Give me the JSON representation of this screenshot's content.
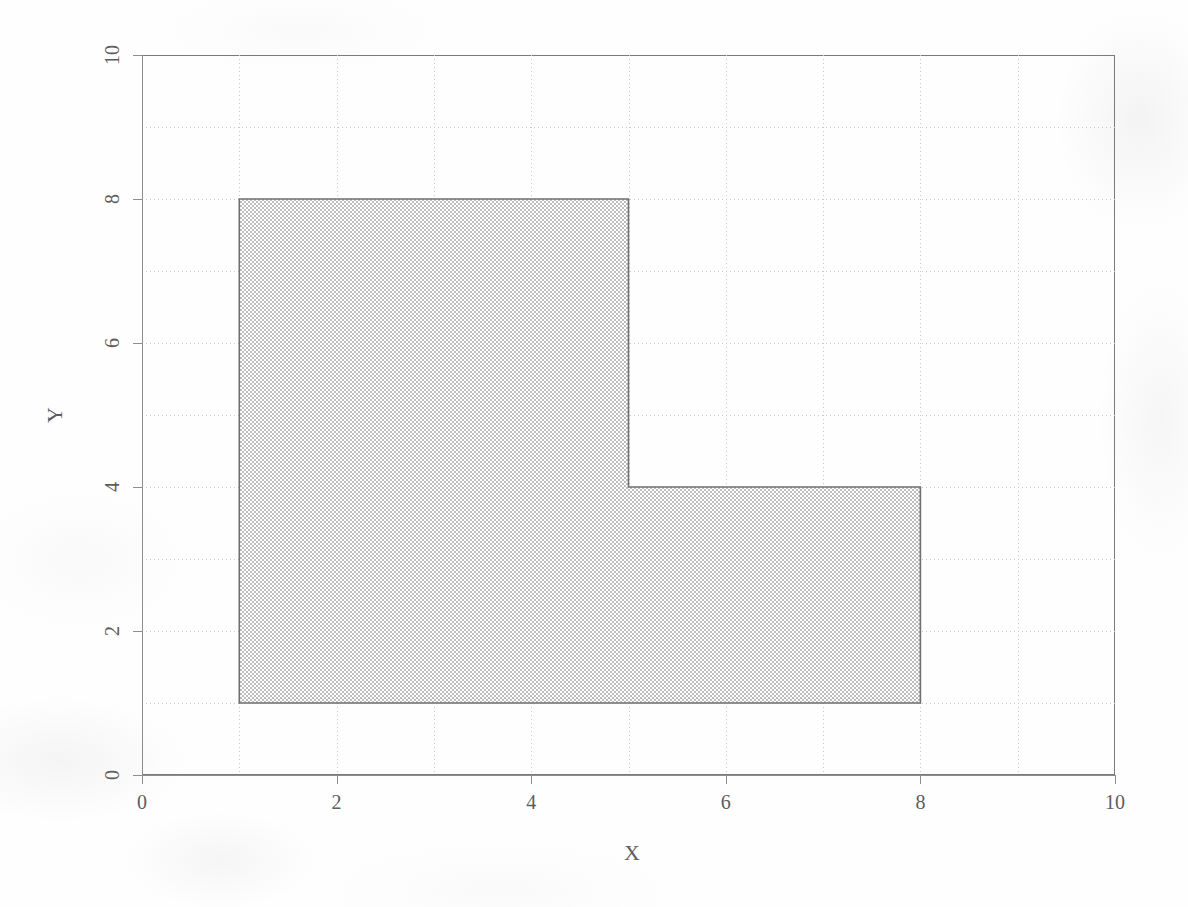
{
  "chart_data": {
    "type": "area",
    "title": "",
    "xlabel": "X",
    "ylabel": "Y",
    "xlim": [
      0,
      10
    ],
    "ylim": [
      0,
      10
    ],
    "xticks": [
      0,
      2,
      4,
      6,
      8,
      10
    ],
    "yticks": [
      0,
      2,
      4,
      6,
      8,
      10
    ],
    "xtick_labels": [
      "0",
      "2",
      "4",
      "6",
      "8",
      "10"
    ],
    "ytick_labels": [
      "0",
      "2",
      "4",
      "6",
      "8",
      "10"
    ],
    "grid": true,
    "grid_step": 1,
    "grid_style": "dotted",
    "grid_color": "#c9c9c9",
    "legend": "none",
    "series": [
      {
        "name": "L-shaped region",
        "type": "polygon",
        "vertices": [
          {
            "x": 1,
            "y": 1
          },
          {
            "x": 1,
            "y": 8
          },
          {
            "x": 5,
            "y": 8
          },
          {
            "x": 5,
            "y": 4
          },
          {
            "x": 8,
            "y": 4
          },
          {
            "x": 8,
            "y": 1
          }
        ],
        "fill_color": "#d9d9d9",
        "fill_pattern": "dither-checker",
        "edge_color": "#6f6f6f"
      }
    ],
    "annotations": []
  },
  "axes": {
    "x_title": "X",
    "y_title": "Y"
  },
  "colors": {
    "axis": "#8d8d8d",
    "grid": "#c9c9c9",
    "tick_text": "#5d5d5d",
    "fill": "#d9d9d9",
    "stroke": "#6f6f6f",
    "background": "#fefefe"
  }
}
